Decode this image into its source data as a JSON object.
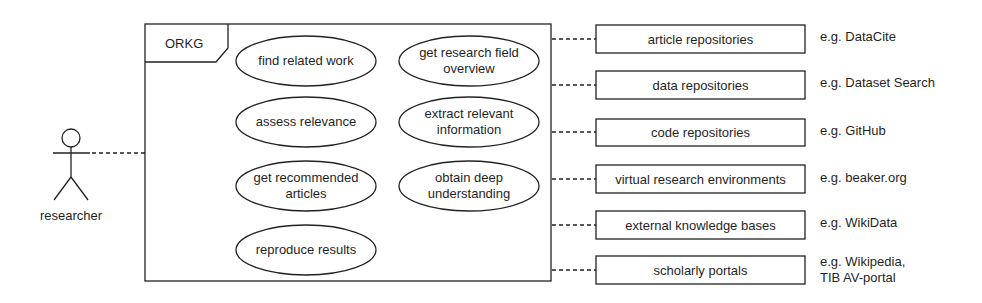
{
  "actor": {
    "label": "researcher"
  },
  "system": {
    "name": "ORKG",
    "use_cases": [
      {
        "id": "find-related-work",
        "label": "find related work"
      },
      {
        "id": "get-research-field-overview",
        "label": "get research field\noverview"
      },
      {
        "id": "assess-relevance",
        "label": "assess relevance"
      },
      {
        "id": "extract-relevant-information",
        "label": "extract relevant\ninformation"
      },
      {
        "id": "get-recommended-articles",
        "label": "get recommended\narticles"
      },
      {
        "id": "obtain-deep-understanding",
        "label": "obtain deep\nunderstanding"
      },
      {
        "id": "reproduce-results",
        "label": "reproduce results"
      }
    ]
  },
  "external_systems": [
    {
      "label": "article repositories",
      "example": "e.g. DataCite"
    },
    {
      "label": "data repositories",
      "example": "e.g. Dataset Search"
    },
    {
      "label": "code repositories",
      "example": "e.g. GitHub"
    },
    {
      "label": "virtual research environments",
      "example": "e.g. beaker.org"
    },
    {
      "label": "external knowledge bases",
      "example": "e.g. WikiData"
    },
    {
      "label": "scholarly portals",
      "example": "e.g. Wikipedia,\nTIB AV-portal"
    }
  ]
}
